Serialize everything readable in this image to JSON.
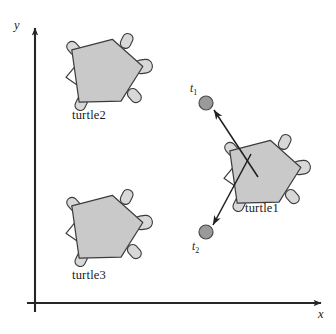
{
  "figure": {
    "background_color": "#ffffff",
    "width": 336,
    "height": 334
  },
  "axes": {
    "x_label": "x",
    "y_label": "y",
    "stroke_color": "#262626",
    "origin": {
      "x": 35,
      "y": 303
    },
    "x_end": {
      "x": 327,
      "y": 303
    },
    "y_end": {
      "x": 35,
      "y": 24
    }
  },
  "style": {
    "body_fill": "#c9c9c9",
    "body_stroke": "#3c3c3c",
    "limb_fill": "#d8d8d8",
    "limb_stroke": "#3c3c3c",
    "marker_fill": "#9a9a9a",
    "marker_stroke": "#4a4a4a",
    "arrow_color": "#1f1f1f"
  },
  "turtles": [
    {
      "id": "turtle2",
      "label": "turtle2",
      "label_pos": {
        "x": 72,
        "y": 108
      },
      "center": {
        "x": 104,
        "y": 72
      },
      "rotation_deg": -8,
      "scale": 1.0
    },
    {
      "id": "turtle3",
      "label": "turtle3",
      "label_pos": {
        "x": 72,
        "y": 268
      },
      "center": {
        "x": 104,
        "y": 228
      },
      "rotation_deg": -8,
      "scale": 1.0
    },
    {
      "id": "turtle1",
      "label": "turtle1",
      "label_pos": {
        "x": 245,
        "y": 201
      },
      "center": {
        "x": 262,
        "y": 173
      },
      "rotation_deg": -8,
      "scale": 1.0
    }
  ],
  "markers": [
    {
      "id": "t1",
      "label": "t",
      "subscript": "1",
      "label_pos": {
        "x": 190,
        "y": 82
      },
      "point": {
        "x": 206,
        "y": 103
      },
      "radius": 7
    },
    {
      "id": "t2",
      "label": "t",
      "subscript": "2",
      "label_pos": {
        "x": 192,
        "y": 240
      },
      "point": {
        "x": 206,
        "y": 232
      },
      "radius": 7
    }
  ],
  "arrows": [
    {
      "id": "arrow-to-t1",
      "from": {
        "x": 258,
        "y": 177
      },
      "to": {
        "x": 214,
        "y": 110
      },
      "target": "t1"
    },
    {
      "id": "arrow-to-t2",
      "from": {
        "x": 251,
        "y": 154
      },
      "to": {
        "x": 213,
        "y": 225
      },
      "target": "t2"
    }
  ]
}
